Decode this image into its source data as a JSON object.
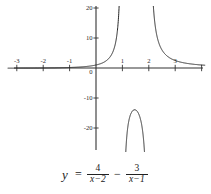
{
  "chart_data": {
    "type": "line",
    "title": "",
    "xlabel": "",
    "ylabel": "",
    "equation_text": "y = 4/(x-2) - 3/(x-1)",
    "function": "4/(x-2) - 3/(x-1)",
    "xlim": [
      -3.5,
      4.1
    ],
    "ylim": [
      -24,
      21
    ],
    "grid": false,
    "legend": null,
    "x_ticks": [
      -3,
      -2,
      -1,
      0,
      1,
      2,
      3
    ],
    "x_tick_labels": [
      "-3",
      "-2",
      "-1",
      "0",
      "1",
      "2",
      "3"
    ],
    "y_ticks": [
      -20,
      -10,
      0,
      10,
      20
    ],
    "y_tick_labels": [
      "-20",
      "-10",
      "0",
      "10",
      "20"
    ],
    "vertical_asymptotes": [
      1,
      2
    ],
    "horizontal_asymptote": 0,
    "series": [
      {
        "name": "branch-left",
        "description": "x < 1, rises from y~0 at far left to +20 near x=1",
        "x": [
          -3.4,
          -3.0,
          -2.5,
          -2.0,
          -1.5,
          -1.0,
          -0.5,
          0.0,
          0.25,
          0.5,
          0.65,
          0.75,
          0.82,
          0.87,
          0.9,
          0.93,
          0.95,
          0.962
        ],
        "y": [
          -0.058,
          -0.05,
          -0.04,
          -0.0,
          0.057,
          0.166,
          0.36,
          0.999,
          1.478,
          2.333,
          3.146,
          3.965,
          4.912,
          5.96,
          6.929,
          8.64,
          10.39,
          11.9
        ]
      },
      {
        "name": "branch-middle",
        "description": "1 < x < 2, dome peaking near y=-13.9 at x~1.45",
        "x": [
          1.045,
          1.08,
          1.12,
          1.18,
          1.25,
          1.32,
          1.4,
          1.45,
          1.5,
          1.58,
          1.66,
          1.74,
          1.8,
          1.86,
          1.9,
          1.94,
          1.96
        ],
        "y": [
          -70.8,
          -41.3,
          -30.1,
          -22.8,
          -18.3,
          -16.0,
          -14.5,
          -14.1,
          -14.0,
          -14.4,
          -15.5,
          -17.6,
          -20.2,
          -24.9,
          -29.9,
          -41.0,
          -53.1
        ]
      },
      {
        "name": "branch-right",
        "description": "x > 2, falls from +20 near x=2 toward y~0",
        "x": [
          2.042,
          2.06,
          2.1,
          2.15,
          2.22,
          2.3,
          2.4,
          2.5,
          2.65,
          2.8,
          3.0,
          3.2,
          3.45,
          3.7,
          4.0,
          4.1
        ],
        "y": [
          92.1,
          63.9,
          36.6,
          24.0,
          15.7,
          11.8,
          8.83,
          7.33,
          5.97,
          5.12,
          4.5,
          4.17,
          3.92,
          3.78,
          3.5,
          3.2
        ]
      }
    ],
    "colors": {
      "curve": "#262626",
      "axis": "#333333",
      "background": "#ffffff",
      "text": "#2b2b2b"
    }
  },
  "equation": {
    "lhs": "y",
    "equals": "=",
    "term1": {
      "numerator": "4",
      "denominator": "x−2"
    },
    "operator": "−",
    "term2": {
      "numerator": "3",
      "denominator": "x−1"
    }
  },
  "axes": {
    "x_labels": [
      {
        "text": "-3",
        "value": -3
      },
      {
        "text": "-2",
        "value": -2
      },
      {
        "text": "-1",
        "value": -1
      },
      {
        "text": "1",
        "value": 1
      },
      {
        "text": "2",
        "value": 2
      },
      {
        "text": "3",
        "value": 3
      }
    ],
    "y_labels": [
      {
        "text": "20",
        "value": 20
      },
      {
        "text": "10",
        "value": 10
      },
      {
        "text": "0",
        "value": 0
      },
      {
        "text": "-10",
        "value": -10
      },
      {
        "text": "-20",
        "value": -20
      }
    ]
  }
}
